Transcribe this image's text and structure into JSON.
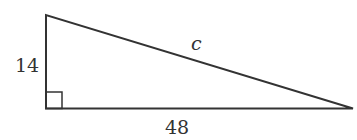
{
  "diagram": {
    "type": "right-triangle",
    "labels": {
      "vertical_leg": "14",
      "hypotenuse": "c",
      "horizontal_leg": "48"
    },
    "vertices": {
      "top": [
        46,
        15
      ],
      "right_angle": [
        46,
        108
      ],
      "right": [
        353,
        109
      ]
    },
    "right_angle_marker": true,
    "stroke_color": "#333333"
  }
}
